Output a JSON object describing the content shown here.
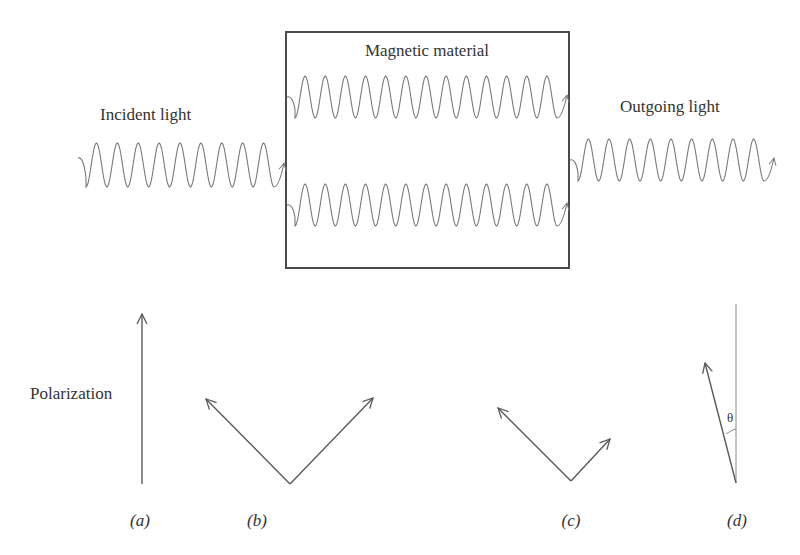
{
  "diagram": {
    "material_label": "Magnetic   material",
    "incident_label": "Incident light",
    "outgoing_label": "Outgoing light",
    "polarization_label": "Polarization",
    "theta_symbol": "θ",
    "panels": [
      {
        "id": "a",
        "label": "(a)",
        "description": "single vertical linear polarization vector"
      },
      {
        "id": "b",
        "label": "(b)",
        "description": "two equal circular components at ±45°"
      },
      {
        "id": "c",
        "label": "(c)",
        "description": "two unequal components after absorption difference"
      },
      {
        "id": "d",
        "label": "(d)",
        "description": "rotated polarization by angle theta from vertical"
      }
    ],
    "waves": [
      {
        "name": "incident-wave",
        "cycles": 9
      },
      {
        "name": "inner-wave-upper",
        "cycles": 13
      },
      {
        "name": "inner-wave-lower",
        "cycles": 13
      },
      {
        "name": "outgoing-wave",
        "cycles": 9
      }
    ]
  }
}
